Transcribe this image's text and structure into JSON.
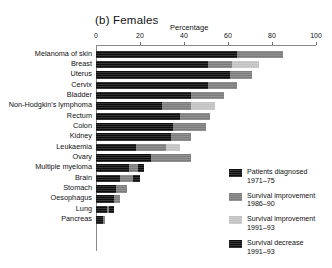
{
  "chart_data": {
    "type": "bar",
    "orientation": "horizontal",
    "stacked": true,
    "title": "(b) Females",
    "xlabel": "Percentage",
    "ylabel": "",
    "xlim": [
      0,
      100
    ],
    "xticks": [
      0,
      20,
      40,
      60,
      80,
      100
    ],
    "grid": false,
    "legend_position": "right",
    "categories": [
      "Melanoma of skin",
      "Breast",
      "Uterus",
      "Cervix",
      "Bladder",
      "Non-Hodgkin's lymphoma",
      "Rectum",
      "Colon",
      "Kidney",
      "Leukaemia",
      "Ovary",
      "Multiple myeloma",
      "Brain",
      "Stomach",
      "Oesophagus",
      "Lung",
      "Pancreas"
    ],
    "series": [
      {
        "name": "Patients diagnosed 1971–75",
        "color": "#0d0d0d",
        "values": [
          64,
          51,
          61,
          51,
          43,
          30,
          38,
          35,
          34,
          18,
          25,
          15,
          11,
          9,
          8,
          5,
          3
        ]
      },
      {
        "name": "Survival improvement 1986–90",
        "color": "#7c7c7c",
        "values": [
          21,
          11,
          10,
          13,
          15,
          13,
          14,
          15,
          9,
          14,
          18,
          4,
          6,
          5,
          3,
          1,
          1
        ]
      },
      {
        "name": "Survival improvement 1991–93",
        "color": "#c2c2c2",
        "values": [
          0,
          12,
          0,
          0,
          0,
          11,
          0,
          0,
          0,
          6,
          0,
          0,
          0,
          0,
          0,
          0,
          0
        ]
      },
      {
        "name": "Survival decrease 1991–93",
        "color": "#0d0d0d",
        "values": [
          0,
          0,
          0,
          0,
          0,
          0,
          0,
          0,
          0,
          0,
          0,
          3,
          3,
          0,
          0,
          2,
          0
        ]
      }
    ],
    "totals": [
      85,
      74,
      71,
      64,
      58,
      54,
      52,
      50,
      43,
      38,
      43,
      22,
      20,
      14,
      11,
      8,
      4
    ]
  },
  "legend": {
    "items": [
      {
        "line1": "Patients diagnosed",
        "line2": "1971–75",
        "color": "#0d0d0d"
      },
      {
        "line1": "Survival improvement",
        "line2": "1986–90",
        "color": "#7c7c7c"
      },
      {
        "line1": "Survival improvement",
        "line2": "1991–93",
        "color": "#c2c2c2"
      },
      {
        "line1": "Survival decrease",
        "line2": "1991–93",
        "color": "#0d0d0d"
      }
    ]
  }
}
